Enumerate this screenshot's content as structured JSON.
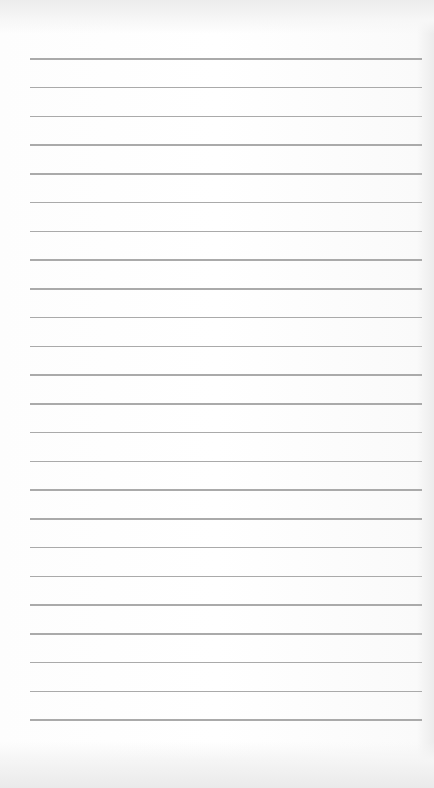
{
  "page": {
    "type": "lined-paper",
    "line_count": 24,
    "first_line_y": 58,
    "line_spacing": 28.75,
    "line_left": 30,
    "line_width": 392,
    "line_color": "#aaaaaa",
    "paper_color": "#ffffff"
  }
}
